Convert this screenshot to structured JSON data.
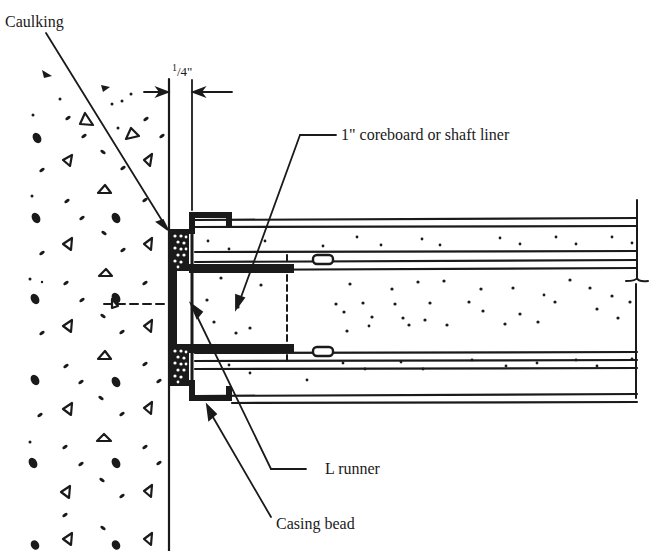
{
  "diagram": {
    "labels": {
      "caulking": "Caulking",
      "gap_dimension_num": "1",
      "gap_dimension_rest": "/4\"",
      "coreboard": "1\" coreboard or shaft liner",
      "l_runner": "L runner",
      "casing_bead": "Casing bead"
    },
    "colors": {
      "ink": "#1a1a1a",
      "background": "#ffffff"
    }
  }
}
